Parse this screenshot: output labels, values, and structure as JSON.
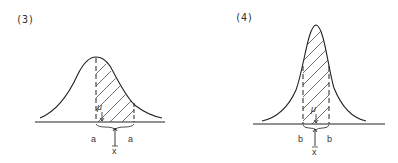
{
  "panels": [
    {
      "label": "(3)",
      "mean_label": "μ",
      "sample_mean_label": "x̄",
      "interval_label_left": "a",
      "interval_label_right": "a",
      "description": "Wide normal curve; shaded interval of half-width a around sample mean x̄, true mean μ lies to the left inside interval"
    },
    {
      "label": "(4)",
      "mean_label": "μ",
      "sample_mean_label": "x̄",
      "interval_label_left": "b",
      "interval_label_right": "b",
      "description": "Narrow tall normal curve; shaded interval of half-width b around x̄, μ nearly coincides with x̄"
    }
  ]
}
